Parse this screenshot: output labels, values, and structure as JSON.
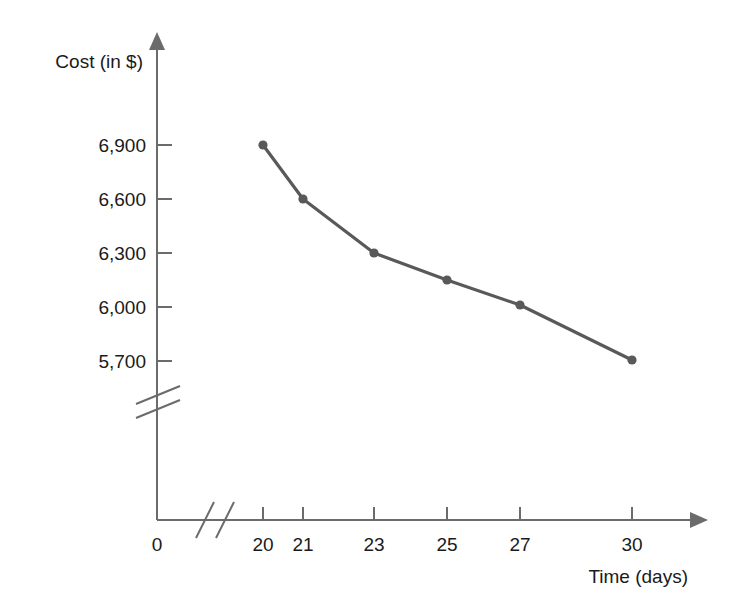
{
  "chart_data": {
    "type": "line",
    "title": "",
    "xlabel": "Time (days)",
    "ylabel": "Cost (in $)",
    "x": [
      20,
      21,
      23,
      25,
      27,
      30
    ],
    "values": [
      6900,
      6600,
      6300,
      6150,
      6010,
      5710
    ],
    "series": [
      {
        "name": "Cost",
        "color": "#595959",
        "values": [
          6900,
          6600,
          6300,
          6150,
          6010,
          5710
        ]
      }
    ],
    "x_tick_labels": [
      "0",
      "20",
      "21",
      "23",
      "25",
      "27",
      "30"
    ],
    "y_tick_labels": [
      "6,900",
      "6,600",
      "6,300",
      "6,000",
      "5,700"
    ],
    "y_tick_values": [
      6900,
      6600,
      6300,
      6000,
      5700
    ],
    "ylim": [
      5700,
      6900
    ],
    "xlim": [
      20,
      30
    ],
    "grid": false,
    "legend": "none",
    "x_axis_break": true,
    "y_axis_break": true,
    "marker": "circle",
    "line_color": "#595959",
    "axis_color": "#6b6b6b"
  },
  "axis": {
    "y_label": "Cost (in $)",
    "x_label": "Time (days)",
    "origin_label": "0"
  },
  "y_ticks": [
    {
      "label": "6,900",
      "y": 145
    },
    {
      "label": "6,600",
      "y": 199
    },
    {
      "label": "6,300",
      "y": 253
    },
    {
      "label": "6,000",
      "y": 307
    },
    {
      "label": "5,700",
      "y": 361
    }
  ],
  "x_ticks": [
    {
      "label": "20",
      "x": 263
    },
    {
      "label": "21",
      "x": 303
    },
    {
      "label": "23",
      "x": 374
    },
    {
      "label": "25",
      "x": 447
    },
    {
      "label": "27",
      "x": 520
    },
    {
      "label": "30",
      "x": 632
    }
  ],
  "points": [
    {
      "x": 263,
      "y": 145,
      "xv": 20,
      "yv": 6900
    },
    {
      "x": 303,
      "y": 199,
      "xv": 21,
      "yv": 6600
    },
    {
      "x": 374,
      "y": 253,
      "xv": 23,
      "yv": 6300
    },
    {
      "x": 447,
      "y": 280,
      "xv": 25,
      "yv": 6150
    },
    {
      "x": 520,
      "y": 305,
      "xv": 27,
      "yv": 6010
    },
    {
      "x": 632,
      "y": 360,
      "xv": 30,
      "yv": 5710
    }
  ]
}
